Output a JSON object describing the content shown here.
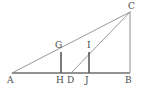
{
  "figure": {
    "background_color": "#ffffff",
    "line_color": "#8c8c8c",
    "label_color": "#4a4a4a",
    "width": 148,
    "height": 95,
    "points": {
      "A": {
        "label": "A",
        "x": 12,
        "y": 73,
        "label_x": 7,
        "label_y": 76
      },
      "B": {
        "label": "B",
        "x": 130,
        "y": 73,
        "label_x": 125,
        "label_y": 76
      },
      "C": {
        "label": "C",
        "x": 130,
        "y": 12,
        "label_x": 128,
        "label_y": 2
      },
      "D": {
        "label": "D",
        "x": 71,
        "y": 73,
        "label_x": 67,
        "label_y": 76
      },
      "G": {
        "label": "G",
        "x": 61,
        "y": 52,
        "label_x": 55,
        "label_y": 41
      },
      "H": {
        "label": "H",
        "x": 61,
        "y": 73,
        "label_x": 56,
        "label_y": 76
      },
      "I": {
        "label": "I",
        "x": 89,
        "y": 52,
        "label_x": 87,
        "label_y": 41
      },
      "J": {
        "label": "J",
        "x": 89,
        "y": 73,
        "label_x": 85,
        "label_y": 76
      }
    },
    "segments": [
      {
        "name": "segment-AB-baseline",
        "from": "A",
        "to": "B",
        "style": "base"
      },
      {
        "name": "segment-AC-hypotenuse",
        "from": "A",
        "to": "C",
        "style": "thin"
      },
      {
        "name": "segment-CB-vertical",
        "from": "C",
        "to": "B",
        "style": "right"
      },
      {
        "name": "segment-DC-cevian",
        "from": "D",
        "to": "C",
        "style": "thin"
      },
      {
        "name": "segment-GH-perpendicular",
        "from": "G",
        "to": "H",
        "style": "drop"
      },
      {
        "name": "segment-IJ-perpendicular",
        "from": "I",
        "to": "J",
        "style": "drop"
      }
    ]
  }
}
